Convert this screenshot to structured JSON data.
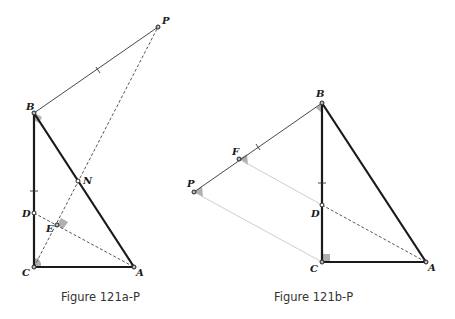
{
  "figures": [
    {
      "caption": "Figure 121a-P",
      "points": {
        "P": {
          "label": "P",
          "x": 158,
          "y": 27
        },
        "B": {
          "label": "B",
          "x": 34,
          "y": 113
        },
        "C": {
          "label": "C",
          "x": 34,
          "y": 267
        },
        "A": {
          "label": "A",
          "x": 134,
          "y": 267
        },
        "N": {
          "label": "N",
          "x": 78,
          "y": 181
        },
        "D": {
          "label": "D",
          "x": 34,
          "y": 213
        },
        "E": {
          "label": "E",
          "x": 57,
          "y": 225
        }
      },
      "segments": [
        {
          "from": "B",
          "to": "C",
          "style": "thick"
        },
        {
          "from": "B",
          "to": "A",
          "style": "thick"
        },
        {
          "from": "C",
          "to": "A",
          "style": "thick"
        },
        {
          "from": "B",
          "to": "P",
          "style": "thin",
          "tick": true
        },
        {
          "from": "C",
          "to": "P",
          "style": "dashed"
        },
        {
          "from": "D",
          "to": "A",
          "style": "dashed"
        }
      ],
      "right_angles": [
        "B",
        "E",
        "C"
      ]
    },
    {
      "caption": "Figure 121b-P",
      "points": {
        "B": {
          "label": "B",
          "x": 322,
          "y": 103
        },
        "C": {
          "label": "C",
          "x": 322,
          "y": 262
        },
        "A": {
          "label": "A",
          "x": 426,
          "y": 262
        },
        "D": {
          "label": "D",
          "x": 322,
          "y": 205
        },
        "F": {
          "label": "F",
          "x": 239,
          "y": 159
        },
        "P": {
          "label": "P",
          "x": 194,
          "y": 192
        }
      },
      "segments": [
        {
          "from": "B",
          "to": "C",
          "style": "thick",
          "tick": true
        },
        {
          "from": "B",
          "to": "A",
          "style": "thick"
        },
        {
          "from": "C",
          "to": "A",
          "style": "thick"
        },
        {
          "from": "B",
          "to": "P",
          "style": "thin",
          "tick": true
        },
        {
          "from": "D",
          "to": "A",
          "style": "dashed"
        },
        {
          "from": "F",
          "to": "D",
          "style": "light"
        },
        {
          "from": "P",
          "to": "C",
          "style": "light"
        }
      ],
      "right_angles": [
        "C"
      ],
      "angle_marks": [
        "B",
        "F",
        "P"
      ]
    }
  ]
}
